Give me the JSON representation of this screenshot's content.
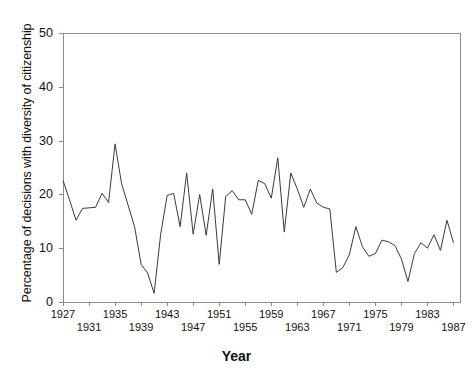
{
  "chart_data": {
    "type": "line",
    "title": "",
    "xlabel": "Year",
    "ylabel": "Percentage of decisions with diversity of citizenship",
    "xlim": [
      1927,
      1988
    ],
    "ylim": [
      0,
      50
    ],
    "grid": false,
    "legend": null,
    "y_ticks": [
      0,
      10,
      20,
      30,
      40,
      50
    ],
    "y_tick_labels": [
      "0",
      "10",
      "20",
      "30",
      "40",
      "50"
    ],
    "x_ticks_upper": [
      1927,
      1935,
      1943,
      1951,
      1959,
      1967,
      1975,
      1983
    ],
    "x_ticks_lower": [
      1931,
      1939,
      1947,
      1955,
      1963,
      1971,
      1979,
      1987
    ],
    "x_tick_labels_upper": [
      "1927",
      "1935",
      "1943",
      "1951",
      "1959",
      "1967",
      "1975",
      "1983"
    ],
    "x_tick_labels_lower": [
      "1931",
      "1939",
      "1947",
      "1955",
      "1963",
      "1971",
      "1979",
      "1987"
    ],
    "line_color": "#3a3a3a",
    "frame_color": "#8c8c8c",
    "x": [
      1927,
      1928,
      1929,
      1930,
      1931,
      1932,
      1933,
      1934,
      1935,
      1936,
      1937,
      1938,
      1939,
      1940,
      1941,
      1942,
      1943,
      1944,
      1945,
      1946,
      1947,
      1948,
      1949,
      1950,
      1951,
      1952,
      1953,
      1954,
      1955,
      1956,
      1957,
      1958,
      1959,
      1960,
      1961,
      1962,
      1963,
      1964,
      1965,
      1966,
      1967,
      1968,
      1969,
      1970,
      1971,
      1972,
      1973,
      1974,
      1975,
      1976,
      1977,
      1978,
      1979,
      1980,
      1981,
      1982,
      1983,
      1984,
      1985,
      1986,
      1987
    ],
    "values": [
      22.6,
      19.0,
      15.2,
      17.4,
      17.5,
      17.6,
      20.2,
      18.5,
      29.4,
      22.0,
      18.0,
      14.0,
      7.0,
      5.4,
      1.6,
      12.5,
      19.8,
      20.2,
      14.0,
      24.0,
      12.6,
      20.0,
      12.4,
      21.0,
      7.0,
      19.6,
      20.7,
      19.0,
      19.0,
      16.3,
      22.6,
      22.0,
      19.3,
      26.8,
      13.0,
      24.0,
      21.0,
      17.6,
      21.0,
      18.4,
      17.6,
      17.3,
      5.5,
      6.4,
      8.8,
      14.0,
      10.3,
      8.5,
      9.0,
      11.5,
      11.2,
      10.5,
      8.0,
      3.8,
      9.0,
      11.0,
      10.0,
      12.5,
      9.6,
      15.2,
      11.0
    ]
  }
}
